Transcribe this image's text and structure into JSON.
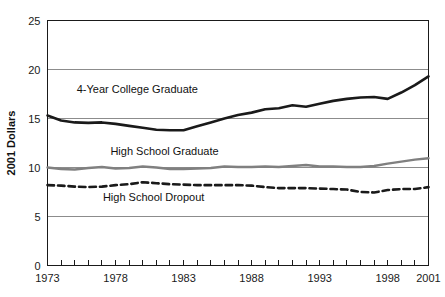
{
  "chart_data": {
    "type": "line",
    "title": "",
    "xlabel": "",
    "ylabel": "2001 Dollars",
    "xlim": [
      1973,
      2001
    ],
    "ylim": [
      0,
      25
    ],
    "grid": true,
    "legend_position": "inline-labels",
    "y_ticks": [
      "0",
      "5",
      "10",
      "15",
      "20",
      "25"
    ],
    "y_tick_values": [
      0,
      5,
      10,
      15,
      20,
      25
    ],
    "x_ticks": [
      "1973",
      "1978",
      "1983",
      "1988",
      "1993",
      "1998",
      "2001"
    ],
    "x_tick_values": [
      1973,
      1978,
      1983,
      1988,
      1993,
      1998,
      2001
    ],
    "x_minor_tick_values": [
      1973,
      1974,
      1975,
      1976,
      1977,
      1978,
      1979,
      1980,
      1981,
      1982,
      1983,
      1984,
      1985,
      1986,
      1987,
      1988,
      1989,
      1990,
      1991,
      1992,
      1993,
      1994,
      1995,
      1996,
      1997,
      1998,
      1999,
      2000,
      2001
    ],
    "x": [
      1973,
      1974,
      1975,
      1976,
      1977,
      1978,
      1979,
      1980,
      1981,
      1982,
      1983,
      1984,
      1985,
      1986,
      1987,
      1988,
      1989,
      1990,
      1991,
      1992,
      1993,
      1994,
      1995,
      1996,
      1997,
      1998,
      1999,
      2000,
      2001
    ],
    "series": [
      {
        "name": "4-Year College Graduate",
        "label": "4-Year College Graduate",
        "color": "#1a1a1a",
        "style": "solid",
        "width": 2.6,
        "label_x": 1979.6,
        "label_y": 17.6,
        "values": [
          15.3,
          14.8,
          14.6,
          14.55,
          14.6,
          14.45,
          14.25,
          14.05,
          13.85,
          13.8,
          13.8,
          14.2,
          14.6,
          15.0,
          15.35,
          15.6,
          15.95,
          16.05,
          16.35,
          16.2,
          16.5,
          16.8,
          17.0,
          17.15,
          17.2,
          17.0,
          17.65,
          18.4,
          19.3
        ]
      },
      {
        "name": "High School Graduate",
        "label": "High School Graduate",
        "color": "#808080",
        "style": "solid",
        "width": 2.4,
        "label_x": 1981.6,
        "label_y": 11.3,
        "values": [
          10.0,
          9.85,
          9.8,
          9.95,
          10.05,
          9.9,
          9.95,
          10.1,
          10.0,
          9.85,
          9.85,
          9.9,
          9.95,
          10.1,
          10.05,
          10.05,
          10.1,
          10.05,
          10.15,
          10.25,
          10.1,
          10.1,
          10.05,
          10.05,
          10.15,
          10.4,
          10.6,
          10.8,
          10.95
        ]
      },
      {
        "name": "High School Dropout",
        "label": "High School Dropout",
        "color": "#1a1a1a",
        "style": "dashed",
        "width": 2.6,
        "label_x": 1980.8,
        "label_y": 6.6,
        "values": [
          8.2,
          8.15,
          8.05,
          8.0,
          8.05,
          8.2,
          8.3,
          8.5,
          8.4,
          8.3,
          8.25,
          8.2,
          8.2,
          8.2,
          8.2,
          8.15,
          8.0,
          7.9,
          7.9,
          7.9,
          7.85,
          7.8,
          7.75,
          7.5,
          7.45,
          7.7,
          7.8,
          7.8,
          8.0
        ]
      }
    ]
  },
  "axes": {
    "y_axis_title": "2001 Dollars"
  }
}
